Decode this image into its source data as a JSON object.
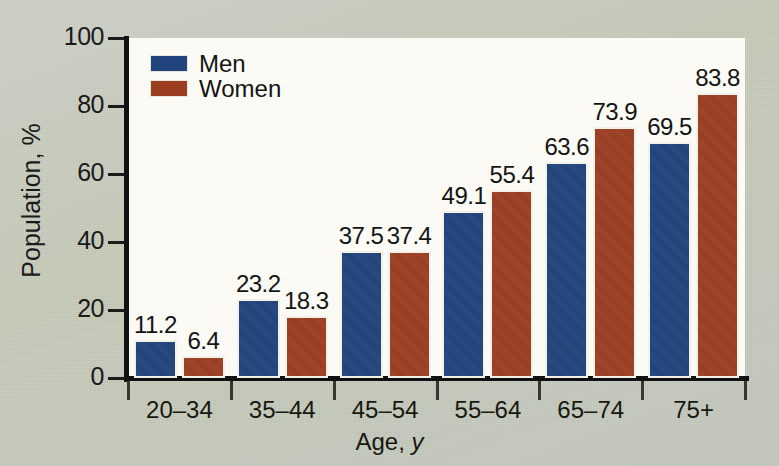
{
  "chart_data": {
    "type": "bar",
    "title": "",
    "xlabel": "Age, y",
    "ylabel": "Population, %",
    "categories": [
      "20–34",
      "35–44",
      "45–54",
      "55–64",
      "65–74",
      "75+"
    ],
    "series": [
      {
        "name": "Men",
        "color": "#21447e",
        "values": [
          11.2,
          23.2,
          37.5,
          49.1,
          63.6,
          69.5
        ]
      },
      {
        "name": "Women",
        "color": "#9c3e22",
        "values": [
          6.4,
          18.3,
          37.4,
          55.4,
          73.9,
          83.8
        ]
      }
    ],
    "ylim": [
      0,
      100
    ],
    "yticks": [
      0,
      20,
      40,
      60,
      80,
      100
    ],
    "ytick_labels": [
      "0",
      "20",
      "40",
      "60",
      "80",
      "100"
    ],
    "grid": false,
    "legend_position": "top-left",
    "value_labels": [
      "11.2",
      "6.4",
      "23.2",
      "18.3",
      "37.5",
      "37.4",
      "49.1",
      "55.4",
      "63.6",
      "73.9",
      "69.5",
      "83.8"
    ],
    "background_color": "#c6cac1",
    "plot_background_color": "#fbfaf4",
    "axis_color": "#111111"
  }
}
